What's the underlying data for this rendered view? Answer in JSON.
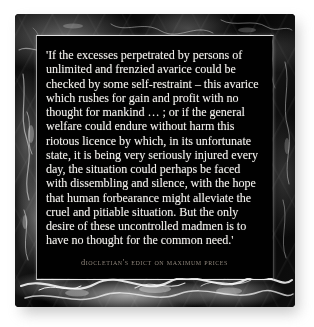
{
  "artifact": {
    "type": "marble-plaque",
    "material": "black marble with white veining"
  },
  "colors": {
    "background": "#ffffff",
    "frame": "#080808",
    "panel": "#010101",
    "quote_text": "#f4f2ee",
    "attribution_text": "#8e857b",
    "bevel_highlight": "#ececec",
    "shadow": "#9a9a9a"
  },
  "plaque": {
    "quote": "'If the excesses perpetrated by persons of unlimited and frenzied avarice could be checked by some self-restraint – this avarice which rushes for gain and profit with no thought for mankind … ; or if the general welfare could endure without harm this riotous licence by which, in its unfortunate state, it is being very seriously injured every day, the situation could perhaps be faced with dissembling and silence, with the hope that human forbearance might alleviate the cruel and pitiable situation. But the only desire of these uncontrolled madmen is to have no thought for the common need.'",
    "quote_lines": [
      "'If the excesses perpetrated by persons of",
      "unlimited and frenzied avarice could be",
      "checked by some self-restraint – this avarice",
      "which rushes for gain and profit with no",
      "thought for mankind … ; or if the general",
      "welfare could endure without harm this",
      "riotous licence by which, in its unfortunate",
      "state, it is being very seriously injured every",
      "day, the situation could perhaps be faced",
      "with dissembling and silence, with the hope",
      "that human forbearance might alleviate the",
      "cruel and pitiable situation. But the only",
      "desire of these uncontrolled madmen is to",
      "have no thought for the common need.'"
    ],
    "attribution": "Diocletian's Edict on Maximum Prices"
  }
}
